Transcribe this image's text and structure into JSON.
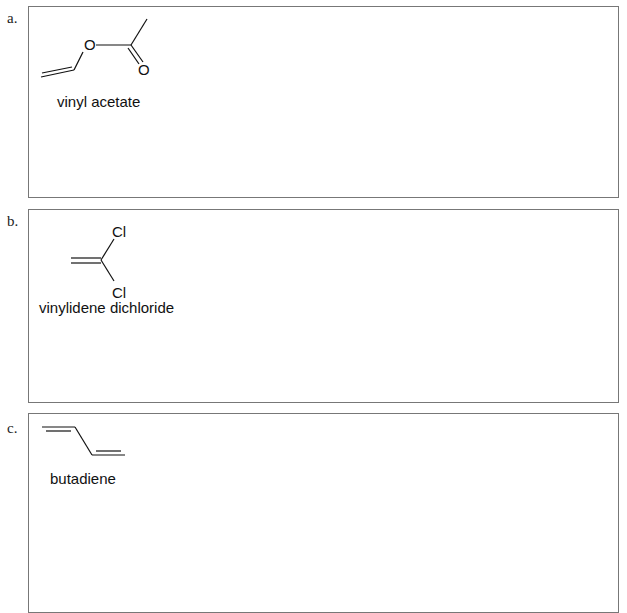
{
  "problems": [
    {
      "label": "a.",
      "compound_name": "vinyl acetate",
      "atoms": [
        "O",
        "O"
      ]
    },
    {
      "label": "b.",
      "compound_name": "vinylidene dichloride",
      "atoms": [
        "Cl",
        "Cl"
      ]
    },
    {
      "label": "c.",
      "compound_name": "butadiene",
      "atoms": []
    }
  ]
}
